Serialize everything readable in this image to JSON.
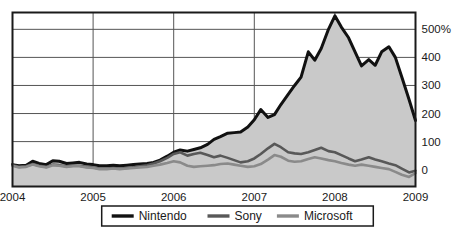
{
  "chart_data": {
    "type": "line",
    "title": "",
    "subtitle": "",
    "xlabel": "",
    "ylabel": "",
    "area_fill_series": "Nintendo",
    "grid": true,
    "legend_position": "bottom",
    "xlim": [
      2004,
      2009
    ],
    "ylim": [
      -60,
      560
    ],
    "yticks": [
      0,
      100,
      200,
      300,
      400,
      500
    ],
    "ytick_labels": [
      "0",
      "100",
      "200",
      "300",
      "400",
      "500%"
    ],
    "xticks": [
      2004,
      2005,
      2006,
      2007,
      2008,
      2009
    ],
    "xtick_labels": [
      "2004",
      "2005",
      "2006",
      "2007",
      "2008",
      "2009"
    ],
    "x": [
      2004.0,
      2004.08,
      2004.17,
      2004.25,
      2004.33,
      2004.42,
      2004.5,
      2004.58,
      2004.67,
      2004.75,
      2004.83,
      2004.92,
      2005.0,
      2005.08,
      2005.17,
      2005.25,
      2005.33,
      2005.42,
      2005.5,
      2005.58,
      2005.67,
      2005.75,
      2005.83,
      2005.92,
      2006.0,
      2006.08,
      2006.17,
      2006.25,
      2006.33,
      2006.42,
      2006.5,
      2006.58,
      2006.67,
      2006.75,
      2006.83,
      2006.92,
      2007.0,
      2007.08,
      2007.17,
      2007.25,
      2007.33,
      2007.42,
      2007.5,
      2007.58,
      2007.67,
      2007.75,
      2007.83,
      2007.92,
      2008.0,
      2008.08,
      2008.17,
      2008.25,
      2008.33,
      2008.42,
      2008.5,
      2008.58,
      2008.67,
      2008.75,
      2008.83,
      2008.92,
      2009.0
    ],
    "series": [
      {
        "name": "Nintendo",
        "color": "#111111",
        "width": 3.0,
        "fill": "#c9c9c9",
        "values": [
          18,
          14,
          16,
          30,
          22,
          18,
          32,
          30,
          22,
          24,
          26,
          20,
          18,
          14,
          14,
          16,
          14,
          16,
          18,
          20,
          22,
          26,
          34,
          48,
          62,
          70,
          66,
          72,
          78,
          90,
          108,
          118,
          130,
          132,
          134,
          152,
          178,
          214,
          186,
          196,
          232,
          268,
          300,
          330,
          420,
          390,
          432,
          500,
          548,
          508,
          470,
          420,
          370,
          392,
          372,
          420,
          438,
          400,
          330,
          250,
          175
        ]
      },
      {
        "name": "Sony",
        "color": "#585858",
        "width": 2.6,
        "values": [
          16,
          10,
          12,
          20,
          14,
          10,
          18,
          16,
          12,
          14,
          14,
          10,
          8,
          4,
          4,
          6,
          4,
          6,
          8,
          12,
          16,
          22,
          30,
          42,
          56,
          62,
          50,
          56,
          60,
          52,
          44,
          50,
          42,
          34,
          26,
          30,
          40,
          56,
          76,
          92,
          80,
          62,
          58,
          56,
          62,
          70,
          78,
          66,
          62,
          52,
          40,
          30,
          36,
          44,
          36,
          30,
          22,
          16,
          4,
          -10,
          -4
        ]
      },
      {
        "name": "Microsoft",
        "color": "#8a8a8a",
        "width": 2.6,
        "values": [
          14,
          8,
          10,
          18,
          12,
          8,
          16,
          14,
          10,
          12,
          12,
          8,
          6,
          2,
          2,
          4,
          2,
          4,
          6,
          8,
          10,
          14,
          18,
          24,
          30,
          26,
          14,
          10,
          12,
          14,
          16,
          20,
          22,
          18,
          14,
          10,
          12,
          20,
          36,
          52,
          46,
          32,
          28,
          30,
          38,
          44,
          40,
          34,
          30,
          24,
          18,
          14,
          18,
          14,
          10,
          6,
          2,
          -8,
          -18,
          -26,
          -12
        ]
      }
    ]
  },
  "legend": {
    "items": [
      {
        "label": "Nintendo",
        "color": "#111111"
      },
      {
        "label": "Sony",
        "color": "#585858"
      },
      {
        "label": "Microsoft",
        "color": "#8a8a8a"
      }
    ]
  },
  "axes": {
    "y_axis_name": "percent-change-axis",
    "x_axis_name": "year-axis"
  },
  "colors": {
    "plot_border": "#1a1a1a",
    "gridline": "#555555",
    "area_fill": "#c9c9c9",
    "background": "#ffffff",
    "text": "#1a1a1a"
  }
}
